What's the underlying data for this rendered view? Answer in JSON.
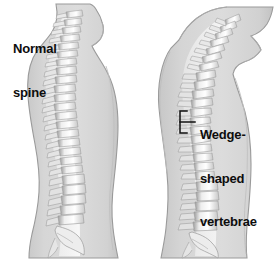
{
  "illustration": {
    "title": "Normal spine versus kyphosis lateral comparison",
    "background_color": "#ffffff",
    "body_fill_color": "#d4d4d4",
    "body_outline_color": "#9a9a9a",
    "bone_light_color": "#fbfbfb",
    "bone_shadow_color": "#a8a8a8",
    "label_text_color": "#0d0d0d"
  },
  "panels": [
    {
      "id": "normal",
      "label_lines": [
        "Normal",
        "spine"
      ],
      "label_full": "Normal spine",
      "description": "Lateral silhouette of upper body with normally curved spinal column"
    },
    {
      "id": "kyphosis",
      "label_lines": [
        "Kyphosis"
      ],
      "label_full": "Kyphosis",
      "description": "Lateral silhouette of upper body with exaggerated forward thoracic curve"
    }
  ],
  "annotations": [
    {
      "id": "wedge-vertebrae",
      "lines": [
        "Wedge-",
        "shaped",
        "vertebrae"
      ],
      "full_text": "Wedge-shaped vertebrae",
      "pointer": "bracket-with-leader-line",
      "points_to": "thoracic vertebrae of kyphosis figure"
    }
  ]
}
